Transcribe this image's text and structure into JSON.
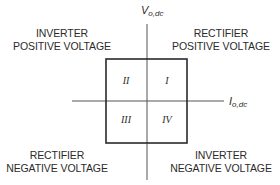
{
  "diagram": {
    "type": "four-quadrant operation diagram",
    "axes": {
      "vertical": {
        "symbol": "V",
        "subscript": "o,dc"
      },
      "horizontal": {
        "symbol": "I",
        "subscript": "o,dc"
      }
    },
    "quadrants": [
      {
        "id": "I",
        "numeral": "I",
        "mode": "RECTIFIER",
        "polarity": "POSITIVE VOLTAGE"
      },
      {
        "id": "II",
        "numeral": "II",
        "mode": "INVERTER",
        "polarity": "POSITIVE VOLTAGE"
      },
      {
        "id": "III",
        "numeral": "III",
        "mode": "RECTIFIER",
        "polarity": "NEGATIVE VOLTAGE"
      },
      {
        "id": "IV",
        "numeral": "IV",
        "mode": "INVERTER",
        "polarity": "NEGATIVE VOLTAGE"
      }
    ],
    "colors": {
      "line": "#3a3a3a",
      "box": "#2a2a2a",
      "text": "#2b2b2b"
    }
  }
}
